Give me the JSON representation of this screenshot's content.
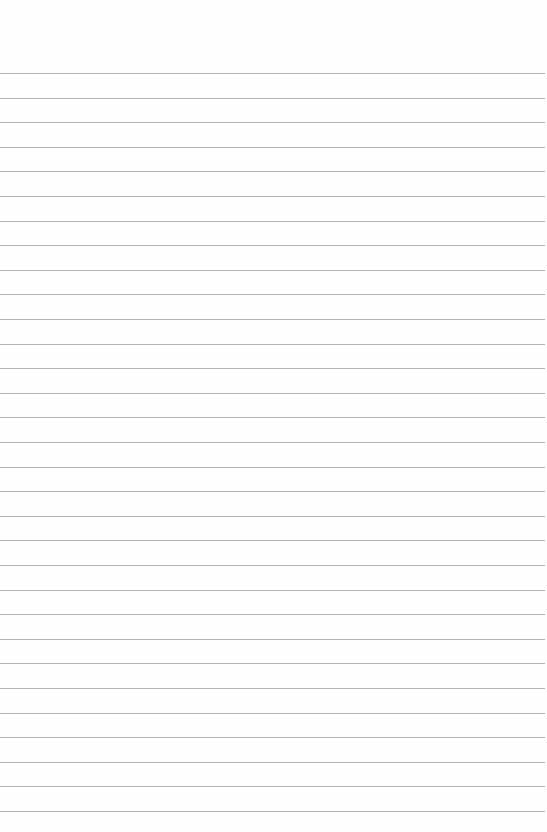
{
  "paper": {
    "type": "lined-paper",
    "background_color": "#fefefe",
    "line_color": "#b4b4b4",
    "first_line_y": 73,
    "line_spacing": 24.6,
    "line_count": 31
  }
}
